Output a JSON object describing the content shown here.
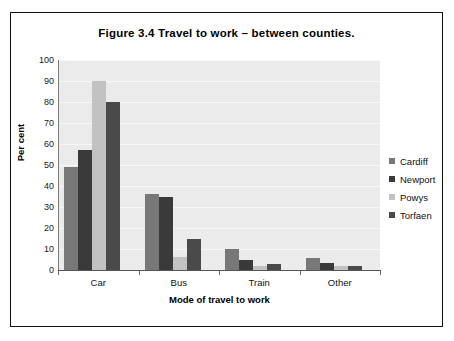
{
  "figure": {
    "title": "Figure 3.4   Travel to work – between counties."
  },
  "chart_data": {
    "type": "bar",
    "title": "Figure 3.4   Travel to work – between counties.",
    "xlabel": "Mode of travel to work",
    "ylabel": "Per cent",
    "ylim": [
      0,
      100
    ],
    "ytick_step": 10,
    "ytick_labels": [
      "0",
      "10",
      "20",
      "30",
      "40",
      "50",
      "60",
      "70",
      "80",
      "90",
      "100"
    ],
    "grid": true,
    "legend_position": "right",
    "categories": [
      "Car",
      "Bus",
      "Train",
      "Other"
    ],
    "series": [
      {
        "name": "Cardiff",
        "color": "#787878",
        "values": [
          49,
          36,
          10,
          5.5
        ]
      },
      {
        "name": "Newport",
        "color": "#3a3a3a",
        "values": [
          57,
          35,
          5,
          3.5
        ]
      },
      {
        "name": "Powys",
        "color": "#c2c2c2",
        "values": [
          90,
          6,
          2,
          2
        ]
      },
      {
        "name": "Torfaen",
        "color": "#4a4a4a",
        "values": [
          80,
          15,
          3,
          2
        ]
      }
    ]
  }
}
